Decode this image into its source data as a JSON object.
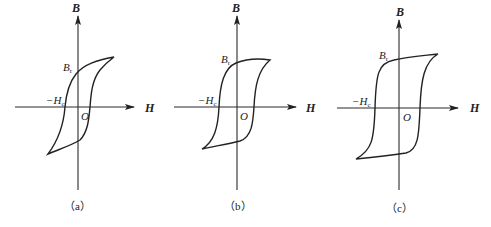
{
  "figure": {
    "panels": [
      {
        "id": "a",
        "caption": "（a）",
        "axis_b_label": "B",
        "axis_h_label": "H",
        "origin_label": "O",
        "remanence_label": "B",
        "remanence_sub": "r",
        "coercivity_label": "−H",
        "coercivity_sub": "c",
        "loop_shape": "narrow slanted hysteresis loop"
      },
      {
        "id": "b",
        "caption": "（b）",
        "axis_b_label": "B",
        "axis_h_label": "H",
        "origin_label": "O",
        "remanence_label": "B",
        "remanence_sub": "r",
        "coercivity_label": "−H",
        "coercivity_sub": "c",
        "loop_shape": "medium hysteresis loop"
      },
      {
        "id": "c",
        "caption": "（c）",
        "axis_b_label": "B",
        "axis_h_label": "H",
        "origin_label": "O",
        "remanence_label": "B",
        "remanence_sub": "r",
        "coercivity_label": "−H",
        "coercivity_sub": "c",
        "loop_shape": "wide rectangular hysteresis loop"
      }
    ]
  },
  "colors": {
    "line": "#222222",
    "background": "#ffffff"
  }
}
